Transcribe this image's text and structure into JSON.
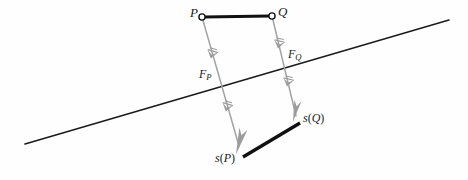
{
  "figure": {
    "background_color": "#fefefe",
    "stroke_colors": {
      "black": "#1a1a1a",
      "gray": "#9c9c9c",
      "gray_light": "#b4b4b4"
    },
    "labels": {
      "p": "P",
      "q": "Q",
      "force_p_base": "F",
      "force_p_sub": "P",
      "force_q_base": "F",
      "force_q_sub": "Q",
      "image_p_fn": "s",
      "image_p_open": "(",
      "image_p_arg": "P",
      "image_p_close": ")",
      "image_q_fn": "s",
      "image_q_open": "(",
      "image_q_arg": "Q",
      "image_q_close": ")"
    },
    "geometry": {
      "segment_pq": {
        "x1": 202,
        "y1": 17,
        "x2": 272,
        "y2": 16
      },
      "segment_spsq": {
        "x1": 243,
        "y1": 157,
        "x2": 300,
        "y2": 123
      },
      "plane_line": {
        "x1": 25,
        "y1": 144,
        "x2": 449,
        "y2": 20
      },
      "vector_p": {
        "x1": 202,
        "y1": 17,
        "x2": 240,
        "y2": 151
      },
      "vector_q": {
        "x1": 272,
        "y1": 16,
        "x2": 297,
        "y2": 121
      },
      "endpoint_radius": 3.1
    }
  }
}
